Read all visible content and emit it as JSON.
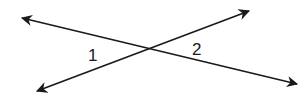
{
  "diagram": {
    "labels": [
      {
        "text": "1",
        "x": 93,
        "y": 61
      },
      {
        "text": "2",
        "x": 197,
        "y": 55
      }
    ],
    "lines": [
      {
        "name": "line-a",
        "from": [
          22,
          18
        ],
        "to": [
          297,
          84
        ]
      },
      {
        "name": "line-b",
        "from": [
          37,
          91
        ],
        "to": [
          249,
          11
        ]
      }
    ],
    "intersection": [
      148,
      49
    ],
    "stroke_color": "#1a1a1a"
  }
}
